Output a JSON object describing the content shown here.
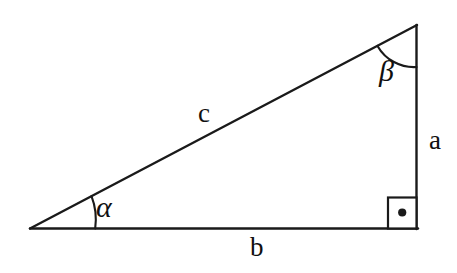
{
  "figure": {
    "kind": "geometry-diagram",
    "shape": "right-triangle",
    "background_color": "#ffffff",
    "stroke_color": "#1a1a1a",
    "stroke_width": 2
  },
  "labels": {
    "side_a": "a",
    "side_b": "b",
    "side_c": "c",
    "angle_alpha": "α",
    "angle_beta": "β"
  },
  "geometry": {
    "vertices": {
      "left": [
        30,
        229
      ],
      "bottom_right": [
        417,
        229
      ],
      "top_right": [
        417,
        25
      ]
    },
    "sides": [
      {
        "name": "b",
        "from": "left",
        "to": "bottom_right",
        "role": "adjacent-base"
      },
      {
        "name": "a",
        "from": "bottom_right",
        "to": "top_right",
        "role": "opposite-vertical"
      },
      {
        "name": "c",
        "from": "left",
        "to": "top_right",
        "role": "hypotenuse"
      }
    ],
    "angles": [
      {
        "name": "α",
        "at": "left",
        "marker": "arc"
      },
      {
        "name": "β",
        "at": "top_right",
        "marker": "arc"
      },
      {
        "name": "right-angle",
        "at": "bottom_right",
        "marker": "square-with-dot",
        "value_degrees": 90
      }
    ],
    "right_angle_marker": {
      "x": 387,
      "y": 197,
      "size": 30,
      "dot_center": [
        402,
        212
      ],
      "dot_radius": 4
    }
  }
}
